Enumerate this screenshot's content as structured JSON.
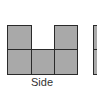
{
  "diagram": {
    "label": "Side",
    "fill_color": "#a9a9a9",
    "stroke_color": "#2a2a2a",
    "view": {
      "name": "side-view",
      "columns": 3,
      "column_heights": [
        2,
        1,
        2
      ],
      "cells": [
        {
          "col": 0,
          "row": 0
        },
        {
          "col": 0,
          "row": 1
        },
        {
          "col": 1,
          "row": 1
        },
        {
          "col": 2,
          "row": 0
        },
        {
          "col": 2,
          "row": 1
        }
      ]
    },
    "partial_next_view": {
      "columns_visible": 1,
      "rows": 2
    }
  }
}
